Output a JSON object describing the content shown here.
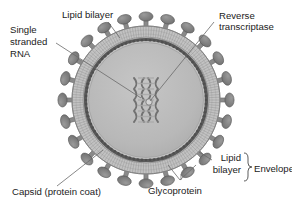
{
  "figure": {
    "background_color": "#ffffff",
    "center": {
      "x": 146,
      "y": 100
    }
  },
  "labels": {
    "lipid_bilayer_top": "Lipid bilayer",
    "reverse_transcriptase_line1": "Reverse",
    "reverse_transcriptase_line2": "transcriptase",
    "single_stranded_rna_line1": "Single",
    "single_stranded_rna_line2": "stranded",
    "single_stranded_rna_line3": "RNA",
    "capsid": "Capsid (protein coat)",
    "glycoprotein": "Glycoprotein",
    "lipid_bilayer_right_line1": "Lipid",
    "lipid_bilayer_right_line2": "bilayer",
    "envelope": "Envelope"
  },
  "structures": {
    "glycoprotein_spike_count": 24,
    "envelope_outer_radius": 74,
    "envelope_inner_radius": 63,
    "capsid_radius": 60,
    "core_radius": 57,
    "spike_stalk_length": 13,
    "spike_head_rx": 7,
    "spike_head_ry": 4.6
  },
  "colors": {
    "background": "#ffffff",
    "envelope_fill": "#c2c2c2",
    "envelope_stripe": "#8e8e8e",
    "capsid_ring": "#5a5a5a",
    "core_fill": "#b9b9b9",
    "spike_head": "#7d7d7d",
    "spike_stalk": "#8a8a8a",
    "rna_fill": "#a8a8a8",
    "rna_stroke": "#6e6e6e",
    "leader_line": "#6a6a6a",
    "text": "#1b1b1b"
  },
  "leader_lines": {
    "lipid_bilayer_top": {
      "from": {
        "x": 108,
        "y": 22
      },
      "to": {
        "x": 120,
        "y": 38
      }
    },
    "reverse_transcriptase": {
      "from": {
        "x": 214,
        "y": 22
      },
      "to": {
        "x": 150,
        "y": 101
      }
    },
    "single_stranded_rna": {
      "from": {
        "x": 56,
        "y": 43
      },
      "to": {
        "x": 141,
        "y": 98
      }
    },
    "capsid": {
      "from": {
        "x": 57,
        "y": 186
      },
      "to": {
        "x": 103,
        "y": 150
      }
    },
    "glycoprotein_a": {
      "from": {
        "x": 180,
        "y": 180
      },
      "to": {
        "x": 168,
        "y": 165
      }
    },
    "glycoprotein_b": {
      "from": {
        "x": 180,
        "y": 180
      },
      "to": {
        "x": 196,
        "y": 165
      }
    },
    "lipid_bilayer_right": {
      "from": {
        "x": 212,
        "y": 160
      },
      "to": {
        "x": 199,
        "y": 152
      }
    }
  }
}
